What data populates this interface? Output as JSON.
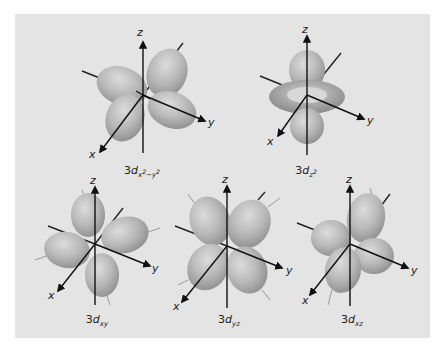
{
  "figure": {
    "background": "#e4e4e4",
    "lobe_color": "#b9b9b9",
    "axis_labels": {
      "x": "x",
      "y": "y",
      "z": "z"
    },
    "orbitals": [
      {
        "id": "dx2-y2",
        "prefix": "3",
        "d": "d",
        "sub": "x",
        "sup1": "2",
        "mid": "−",
        "sub2": "y",
        "sup2": "2",
        "label": "3dx²−y²"
      },
      {
        "id": "dz2",
        "prefix": "3",
        "d": "d",
        "sub": "z",
        "sup1": "2",
        "label": "3dz²"
      },
      {
        "id": "dxy",
        "prefix": "3",
        "d": "d",
        "sub": "xy",
        "label": "3dxy"
      },
      {
        "id": "dyz",
        "prefix": "3",
        "d": "d",
        "sub": "yz",
        "label": "3dyz"
      },
      {
        "id": "dxz",
        "prefix": "3",
        "d": "d",
        "sub": "xz",
        "label": "3dxz"
      }
    ]
  }
}
